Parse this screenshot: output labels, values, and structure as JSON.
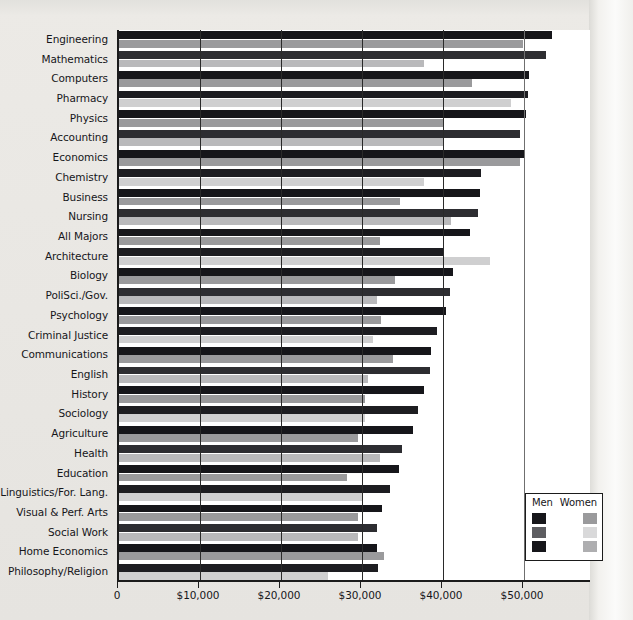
{
  "chart_data": {
    "type": "bar",
    "orientation": "horizontal",
    "title": "",
    "subtitle": "",
    "xlabel": "",
    "ylabel": "",
    "xlim": [
      0,
      58400
    ],
    "grid": true,
    "legend_position": "bottom-right",
    "xticks": [
      0,
      10000,
      20000,
      30000,
      40000,
      50000
    ],
    "xticklabels": [
      "0",
      "$10,000",
      "$20,000",
      "$30,000",
      "$40,000",
      "$50,000"
    ],
    "categories": [
      "Engineering",
      "Mathematics",
      "Computers",
      "Pharmacy",
      "Physics",
      "Accounting",
      "Economics",
      "Chemistry",
      "Business",
      "Nursing",
      "All Majors",
      "Architecture",
      "Biology",
      "PoliSci./Gov.",
      "Psychology",
      "Criminal Justice",
      "Communications",
      "English",
      "History",
      "Sociology",
      "Agriculture",
      "Health",
      "Education",
      "Linguistics/For. Lang.",
      "Visual & Perf. Arts",
      "Social Work",
      "Home Economics",
      "Philosophy/Religion"
    ],
    "series": [
      {
        "name": "Men",
        "color": "#16161a",
        "values": [
          53400,
          52700,
          50600,
          50500,
          50300,
          49500,
          50000,
          44700,
          44600,
          44300,
          43300,
          40000,
          41200,
          40900,
          40400,
          39300,
          38500,
          38400,
          37600,
          36900,
          36300,
          35000,
          34600,
          33500,
          32500,
          31800,
          31900,
          32000
        ]
      },
      {
        "name": "Women",
        "color": "#9a9a9c",
        "values": [
          49900,
          37600,
          43600,
          48400,
          40100,
          40000,
          49500,
          37600,
          34700,
          41000,
          32200,
          45800,
          34100,
          31800,
          32400,
          31300,
          33800,
          30700,
          30400,
          30400,
          29500,
          32200,
          28200,
          30000,
          29500,
          29500,
          32700,
          25800
        ]
      }
    ]
  },
  "legend": {
    "men_label": "Men",
    "women_label": "Women"
  }
}
